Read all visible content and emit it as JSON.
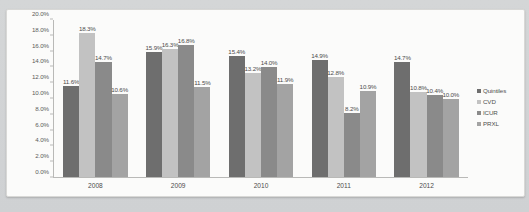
{
  "chart_data": {
    "type": "bar",
    "title": "",
    "subtitle": "",
    "xlabel": "",
    "ylabel": "",
    "categories": [
      "2008",
      "2009",
      "2010",
      "2011",
      "2012"
    ],
    "series": [
      {
        "name": "Quintiles",
        "color": "#6e6e6e",
        "values": [
          11.6,
          15.9,
          15.4,
          14.9,
          14.7
        ],
        "labels": [
          "11.6%",
          "15.9%",
          "15.4%",
          "14.9%",
          "14.7%"
        ]
      },
      {
        "name": "CVD",
        "color": "#c2c2c2",
        "values": [
          18.3,
          16.3,
          13.2,
          12.8,
          10.8
        ],
        "labels": [
          "18.3%",
          "16.3%",
          "13.2%",
          "12.8%",
          "10.8%"
        ]
      },
      {
        "name": "ICUR",
        "color": "#8a8a8a",
        "values": [
          14.7,
          16.8,
          14.0,
          8.2,
          10.4
        ],
        "labels": [
          "14.7%",
          "16.8%",
          "14.0%",
          "8.2%",
          "10.4%"
        ]
      },
      {
        "name": "PRXL",
        "color": "#a3a3a3",
        "values": [
          10.6,
          11.5,
          11.9,
          10.9,
          10.0
        ],
        "labels": [
          "10.6%",
          "11.5%",
          "11.9%",
          "10.9%",
          "10.0%"
        ]
      }
    ],
    "ylim": [
      0,
      20
    ],
    "yticks": [
      0,
      2,
      4,
      6,
      8,
      10,
      12,
      14,
      16,
      18,
      20
    ],
    "ytick_labels": [
      "0.0%",
      "2.0%",
      "4.0%",
      "6.0%",
      "8.0%",
      "10.0%",
      "12.0%",
      "14.0%",
      "16.0%",
      "18.0%",
      "20.0%"
    ],
    "grid": false,
    "legend_position": "right",
    "value_suffix": "%"
  },
  "legend": {
    "entries": [
      "Quintiles",
      "CVD",
      "ICUR",
      "PRXL"
    ]
  },
  "colors": {
    "plate_background": "#fbfbfa",
    "figure_background": "#d2d4d5",
    "axis_line": "#b9b9b7",
    "text": "#4c4c4c"
  }
}
